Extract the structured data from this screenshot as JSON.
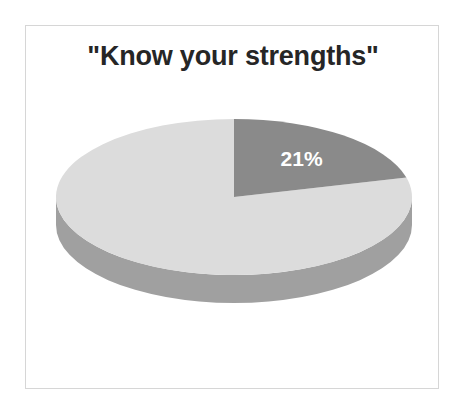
{
  "figure": {
    "background_color": "#ffffff",
    "frame_border_color": "#d6d6d6"
  },
  "chart_data": {
    "type": "pie",
    "title": "\"Know your strengths\"",
    "xlabel": "",
    "ylabel": "",
    "three_d": true,
    "start_angle_deg": 0,
    "direction": "clockwise",
    "legend": "none",
    "grid": false,
    "categories": [
      "Highlighted",
      "Remainder"
    ],
    "values": [
      21,
      79
    ],
    "labels": [
      "21%",
      ""
    ],
    "colors": [
      "#8a8a8a",
      "#dcdcdc"
    ],
    "side_colors": [
      "#767676",
      "#a0a0a0"
    ],
    "label_color": "#ffffff",
    "slices": [
      {
        "name": "Highlighted",
        "value": 21,
        "label": "21%",
        "color": "#8a8a8a",
        "side_color": "#767676",
        "start_deg": 0,
        "end_deg": 75.6
      },
      {
        "name": "Remainder",
        "value": 79,
        "label": "",
        "color": "#dcdcdc",
        "side_color": "#a0a0a0",
        "start_deg": 75.6,
        "end_deg": 360
      }
    ]
  },
  "title": {
    "text": "\"Know your strengths\"",
    "color": "#262626"
  },
  "data_labels": {
    "highlighted": "21%"
  }
}
